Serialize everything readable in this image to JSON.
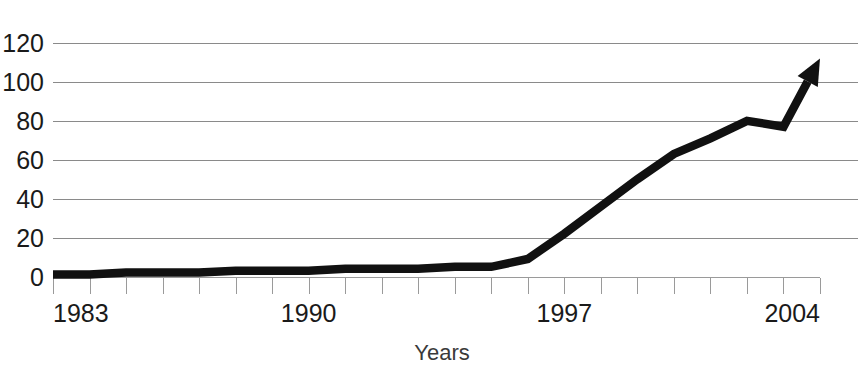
{
  "chart_data": {
    "type": "line",
    "title": "",
    "subtitle": "",
    "xlabel": "Years",
    "ylabel": "",
    "xlim": [
      1983,
      2004
    ],
    "ylim": [
      0,
      120
    ],
    "grid": true,
    "legend": false,
    "legend_position": "none",
    "annotations": [
      "arrowhead at end of line indicating continued growth"
    ],
    "line_color": "#111111",
    "grid_color": "#8a8a8a",
    "axis_color": "#9a9a9a",
    "text_color": "#1a1a1a",
    "background_color": "#ffffff",
    "x_tick_labels": [
      "1983",
      "1990",
      "1997",
      "2004"
    ],
    "x_tick_label_values": [
      1983,
      1990,
      1997,
      2004
    ],
    "x_minor_ticks": [
      1983,
      1984,
      1985,
      1986,
      1987,
      1988,
      1989,
      1990,
      1991,
      1992,
      1993,
      1994,
      1995,
      1996,
      1997,
      1998,
      1999,
      2000,
      2001,
      2002,
      2003,
      2004
    ],
    "y_tick_labels": [
      "0",
      "20",
      "40",
      "60",
      "80",
      "100",
      "120"
    ],
    "y_tick_label_values": [
      0,
      20,
      40,
      60,
      80,
      100,
      120
    ],
    "x": [
      1983,
      1984,
      1985,
      1986,
      1987,
      1988,
      1989,
      1990,
      1991,
      1992,
      1993,
      1994,
      1995,
      1996,
      1997,
      1998,
      1999,
      2000,
      2001,
      2002,
      2003,
      2004
    ],
    "values": [
      1,
      1,
      2,
      2,
      2,
      3,
      3,
      3,
      4,
      4,
      4,
      5,
      5,
      9,
      22,
      36,
      50,
      63,
      71,
      80,
      77,
      112
    ],
    "series": [
      {
        "name": "trend",
        "values": [
          1,
          1,
          2,
          2,
          2,
          3,
          3,
          3,
          4,
          4,
          4,
          5,
          5,
          9,
          22,
          36,
          50,
          63,
          71,
          80,
          77,
          112
        ]
      }
    ]
  },
  "axis": {
    "x_title": "Years"
  }
}
